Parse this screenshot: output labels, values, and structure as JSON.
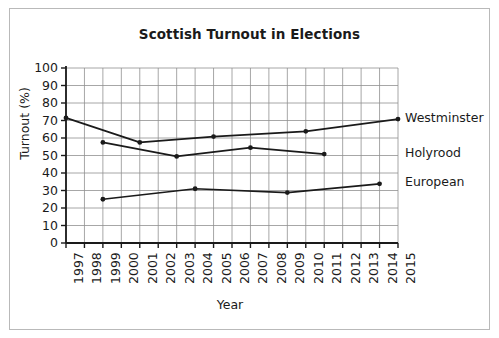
{
  "figure": {
    "background_color": "#ffffff",
    "frame_color": "#b9b9b9"
  },
  "chart_data": {
    "type": "line",
    "title": "Scottish Turnout in Elections",
    "xlabel": "Year",
    "ylabel": "Turnout (%)",
    "xlim": [
      1997,
      2015
    ],
    "ylim": [
      0,
      100
    ],
    "grid": true,
    "legend_position": "right-inline",
    "x_ticks": [
      1997,
      1998,
      1999,
      2000,
      2001,
      2002,
      2003,
      2004,
      2005,
      2006,
      2007,
      2008,
      2009,
      2010,
      2011,
      2012,
      2013,
      2014,
      2015
    ],
    "x_tick_labels": [
      "1997",
      "1998",
      "1999",
      "2000",
      "2001",
      "2002",
      "2003",
      "2004",
      "2005",
      "2006",
      "2007",
      "2008",
      "2009",
      "2010",
      "2011",
      "2012",
      "2013",
      "2014",
      "2015"
    ],
    "y_ticks": [
      0,
      10,
      20,
      30,
      40,
      50,
      60,
      70,
      80,
      90,
      100
    ],
    "y_tick_labels": [
      "0",
      "10",
      "20",
      "30",
      "40",
      "50",
      "60",
      "70",
      "80",
      "90",
      "100"
    ],
    "line_color": "#1a1a1a",
    "series": [
      {
        "name": "Westminster",
        "x": [
          1997,
          2001,
          2005,
          2010,
          2015
        ],
        "values": [
          71.5,
          57.5,
          60.8,
          63.8,
          70.8
        ]
      },
      {
        "name": "Holyrood",
        "x": [
          1999,
          2003,
          2007,
          2011
        ],
        "values": [
          57.5,
          49.5,
          54.5,
          50.8
        ]
      },
      {
        "name": "European",
        "x": [
          1999,
          2004,
          2009,
          2014
        ],
        "values": [
          25.0,
          31.0,
          28.8,
          33.8
        ]
      }
    ]
  }
}
